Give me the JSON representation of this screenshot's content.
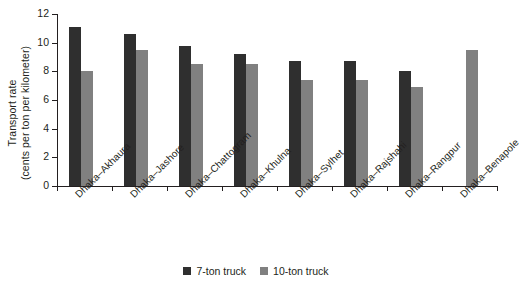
{
  "chart_data": {
    "type": "bar",
    "title": "",
    "subtitle": "",
    "xlabel": "",
    "ylabel": "Transport rate (cents per ton per kilometer)",
    "ylabel_lines": [
      "Transport rate",
      "(cents per ton per kilometer)"
    ],
    "ylim": [
      0,
      12
    ],
    "yticks": [
      0,
      2,
      4,
      6,
      8,
      10,
      12
    ],
    "ytick_labels": [
      "0",
      "2",
      "4",
      "6",
      "8",
      "10",
      "12"
    ],
    "grid": false,
    "legend_position": "bottom-center",
    "categories": [
      "Dhaka–Akhaura",
      "Dhaka–Jashore",
      "Dhaka–Chattogram",
      "Dhaka–Khulna",
      "Dhaka–Sylhet",
      "Dhaka–Rajshahi",
      "Dhaka–Rangpur",
      "Dhaka–Benapole"
    ],
    "series": [
      {
        "name": "7-ton truck",
        "color": "#2f2f2f",
        "values": [
          11.1,
          10.6,
          9.8,
          9.2,
          8.7,
          8.7,
          8.0,
          null
        ]
      },
      {
        "name": "10-ton truck",
        "color": "#808080",
        "values": [
          8.0,
          9.5,
          8.5,
          8.5,
          7.4,
          7.4,
          6.9,
          9.5
        ]
      }
    ]
  },
  "legend": {
    "items": [
      {
        "label": "7-ton truck",
        "color": "#2f2f2f"
      },
      {
        "label": "10-ton truck",
        "color": "#808080"
      }
    ]
  },
  "colors": {
    "series_7ton": "#2f2f2f",
    "series_10ton": "#808080",
    "axis": "#231f20",
    "background": "#ffffff"
  }
}
